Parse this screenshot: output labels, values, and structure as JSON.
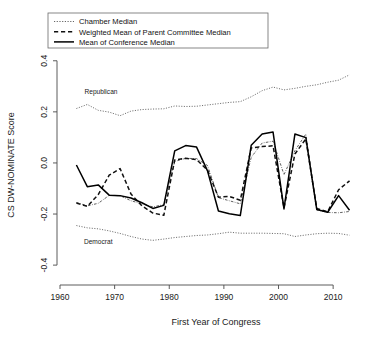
{
  "chart_data": {
    "type": "line",
    "title": "",
    "xlabel": "First Year of Congress",
    "ylabel": "CS DW-NOMINATE Score",
    "xlim": [
      1960,
      2014
    ],
    "ylim": [
      -0.47,
      0.45
    ],
    "xticks": [
      1960,
      1970,
      1980,
      1990,
      2000,
      2010
    ],
    "yticks": [
      -0.4,
      -0.2,
      0.0,
      0.2,
      0.4
    ],
    "ytick_labels": [
      "-0.4",
      "-0.2",
      "0.0",
      "0.2",
      "0.4"
    ],
    "xtick_labels": [
      "1960",
      "1970",
      "1980",
      "1990",
      "2000",
      "2010"
    ],
    "grid": false,
    "legend_position": "top-left",
    "annotations": [
      {
        "text": "Republican",
        "x": 1967.5,
        "y": 0.268
      },
      {
        "text": "Democrat",
        "x": 1967.0,
        "y": -0.318
      }
    ],
    "x": [
      1963,
      1965,
      1967,
      1969,
      1971,
      1973,
      1975,
      1977,
      1979,
      1981,
      1983,
      1985,
      1987,
      1989,
      1991,
      1993,
      1995,
      1997,
      1999,
      2001,
      2003,
      2005,
      2007,
      2009,
      2011,
      2013
    ],
    "series": [
      {
        "name": "Republican",
        "style": "dotted",
        "values": [
          0.213,
          0.229,
          0.206,
          0.199,
          0.185,
          0.203,
          0.209,
          0.211,
          0.212,
          0.223,
          0.221,
          0.222,
          0.227,
          0.232,
          0.237,
          0.24,
          0.259,
          0.283,
          0.297,
          0.286,
          0.292,
          0.3,
          0.306,
          0.316,
          0.324,
          0.345
        ]
      },
      {
        "name": "Democrat",
        "style": "dotted",
        "values": [
          -0.245,
          -0.254,
          -0.258,
          -0.266,
          -0.276,
          -0.288,
          -0.298,
          -0.303,
          -0.298,
          -0.292,
          -0.288,
          -0.284,
          -0.282,
          -0.277,
          -0.271,
          -0.275,
          -0.275,
          -0.275,
          -0.276,
          -0.277,
          -0.288,
          -0.282,
          -0.277,
          -0.275,
          -0.276,
          -0.283
        ]
      },
      {
        "name": "Chamber Median",
        "style": "dotdash",
        "values": [
          -0.155,
          -0.168,
          -0.158,
          -0.127,
          -0.128,
          -0.148,
          -0.16,
          -0.172,
          -0.163,
          0.006,
          0.018,
          0.017,
          -0.01,
          -0.136,
          -0.148,
          -0.16,
          0.022,
          0.078,
          0.085,
          -0.046,
          0.048,
          0.113,
          -0.184,
          -0.194,
          -0.195,
          -0.19
        ]
      },
      {
        "name": "Weighted Mean of Parent Committee Median",
        "style": "dashed",
        "values": [
          -0.157,
          -0.17,
          -0.124,
          -0.048,
          -0.022,
          -0.122,
          -0.168,
          -0.196,
          -0.205,
          0.012,
          0.018,
          0.013,
          -0.028,
          -0.134,
          -0.131,
          -0.146,
          0.059,
          0.064,
          0.067,
          -0.176,
          0.035,
          0.094,
          -0.178,
          -0.191,
          -0.105,
          -0.07
        ]
      },
      {
        "name": "Mean of Conference Median",
        "style": "solid",
        "values": [
          -0.008,
          -0.093,
          -0.086,
          -0.126,
          -0.128,
          -0.137,
          -0.156,
          -0.178,
          -0.166,
          0.047,
          0.068,
          0.062,
          -0.031,
          -0.188,
          -0.199,
          -0.206,
          0.069,
          0.113,
          0.121,
          -0.18,
          0.113,
          0.099,
          -0.182,
          -0.193,
          -0.128,
          -0.185
        ]
      }
    ]
  },
  "legend": {
    "entries": [
      {
        "label": "Chamber Median",
        "key": "dotted-line-key"
      },
      {
        "label": "Weighted Mean of Parent Committee Median",
        "key": "dashed-line-key"
      },
      {
        "label": "Mean of Conference Median",
        "key": "solid-line-key"
      }
    ]
  }
}
